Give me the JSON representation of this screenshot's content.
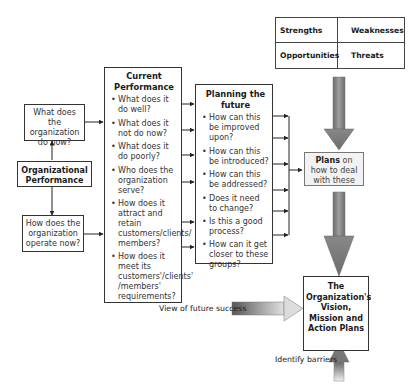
{
  "left": {
    "top_box": "What does the organization do now?",
    "center_box": "Organizational Performance",
    "bottom_box": "How does the organization operate now?"
  },
  "current_performance": {
    "title": "Current Performance",
    "items": [
      "What does it do well?",
      "What does it not do now?",
      "What does it do poorly?",
      "Who does the organization serve?",
      "How does it attract and retain customers/clients/ members?",
      "How does it meet its customers'/clients' /members' requirements?"
    ]
  },
  "planning": {
    "title": "Planning the future",
    "items": [
      "How can this be improved upon?",
      "How can this be introduced?",
      "How can this be addressed?",
      "Does it need to change?",
      "Is this a good process?",
      "How can it get closer to these groups?"
    ]
  },
  "swot": {
    "strengths": "Strengths",
    "weaknesses": "Weaknesses",
    "opportunities": "Opportunities",
    "threats": "Threats"
  },
  "plans": {
    "bold": "Plans",
    "rest": " on how to deal with these"
  },
  "vision": {
    "text": "The Organization's Vision, Mission and Action Plans"
  },
  "labels": {
    "future_success": "View of future success",
    "barriers": "Identify barriers"
  }
}
